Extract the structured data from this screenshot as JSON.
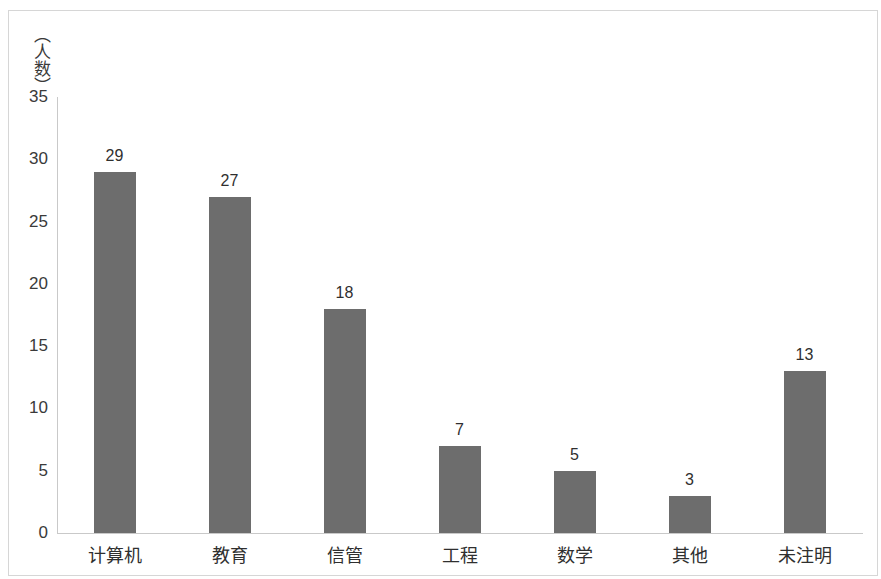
{
  "chart_data": {
    "type": "bar",
    "title": "",
    "subtitle": "",
    "xlabel": "",
    "ylabel": "（人数）",
    "ylabel_chars": [
      "（",
      "人",
      "数",
      "）"
    ],
    "categories": [
      "计算机",
      "教育",
      "信管",
      "工程",
      "数学",
      "其他",
      "未注明"
    ],
    "values": [
      29,
      27,
      18,
      7,
      5,
      3,
      13
    ],
    "data_labels": [
      "29",
      "27",
      "18",
      "7",
      "5",
      "3",
      "13"
    ],
    "ylim": [
      0,
      35
    ],
    "y_ticks": [
      0,
      5,
      10,
      15,
      20,
      25,
      30,
      35
    ],
    "y_tick_labels": [
      "0",
      "5",
      "10",
      "15",
      "20",
      "25",
      "30",
      "35"
    ],
    "grid": false,
    "legend": null,
    "legend_position": "none",
    "bar_color": "#6d6d6d",
    "axis_color": "#c9c9c9",
    "frame_color": "#d6d6d6",
    "background_color": "#ffffff",
    "text_color": "#2f2f2f"
  }
}
